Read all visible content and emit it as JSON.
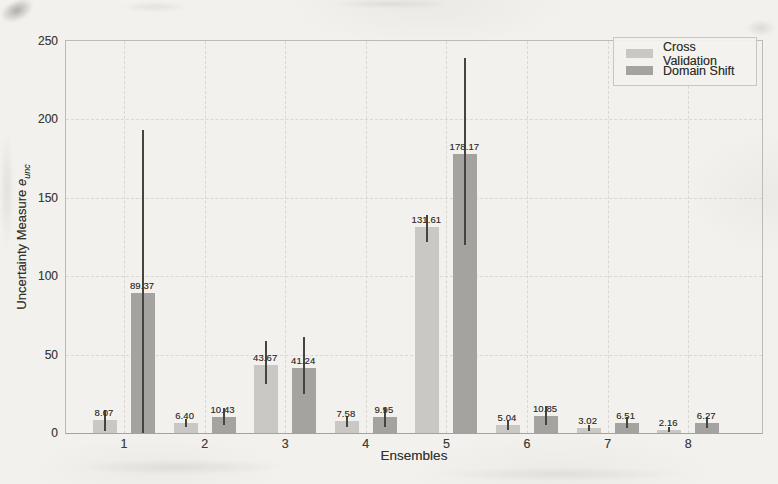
{
  "figure": {
    "xlabel": "Ensembles",
    "ylabel_text": "Uncertainty Measure ",
    "ylabel_var": "e",
    "ylabel_sub": "unc"
  },
  "legend": [
    {
      "label": "Cross Validation",
      "color": "#c9c8c4"
    },
    {
      "label": "Domain Shift",
      "color": "#a4a39f"
    }
  ],
  "chart_data": {
    "type": "bar",
    "title": "",
    "xlabel": "Ensembles",
    "ylabel": "Uncertainty Measure e_unc",
    "categories": [
      "1",
      "2",
      "3",
      "4",
      "5",
      "6",
      "7",
      "8"
    ],
    "series": [
      {
        "name": "Cross Validation",
        "color": "#c9c8c4",
        "values": [
          8.07,
          6.4,
          43.67,
          7.58,
          131.61,
          5.04,
          3.02,
          2.16
        ],
        "error_low": [
          1,
          4,
          31,
          4,
          122,
          2,
          1,
          0.5
        ],
        "error_high": [
          15,
          9,
          59,
          11,
          139,
          8,
          5,
          4
        ]
      },
      {
        "name": "Domain Shift",
        "color": "#a4a39f",
        "values": [
          89.37,
          10.43,
          41.24,
          9.95,
          178.17,
          10.85,
          6.51,
          6.27
        ],
        "error_low": [
          0,
          5,
          25,
          4,
          120,
          5,
          3,
          3
        ],
        "error_high": [
          193,
          16,
          61,
          16,
          239,
          17,
          10,
          10
        ]
      }
    ],
    "bar_labels": [
      [
        "8.07",
        "6.40",
        "43.67",
        "7.58",
        "131.61",
        "5.04",
        "3.02",
        "2.16"
      ],
      [
        "89.37",
        "10.43",
        "41.24",
        "9.95",
        "178.17",
        "10.85",
        "6.51",
        "6.27"
      ]
    ],
    "ylim": [
      0,
      250
    ],
    "yticks": [
      0,
      50,
      100,
      150,
      200,
      250
    ],
    "grid": true,
    "grid_style": "dashed",
    "legend_position": "upper right",
    "error_bars": true
  }
}
